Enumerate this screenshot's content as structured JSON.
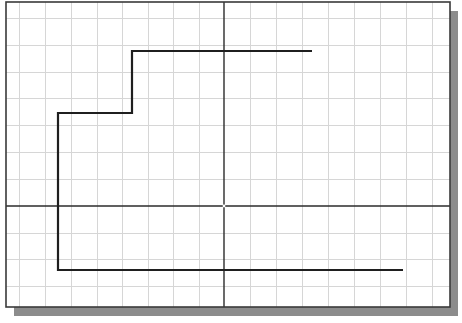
{
  "canvas": {
    "width": 462,
    "height": 323,
    "background": "#ffffff"
  },
  "frame": {
    "x": 6,
    "y": 2,
    "width": 444,
    "height": 305,
    "border_color": "#3a3a3a",
    "border_width": 1.6,
    "fill": "#ffffff"
  },
  "shadow": {
    "offset_x": 8,
    "offset_y": 9,
    "color": "#8c8c8c"
  },
  "grid": {
    "color": "#d6d6d6",
    "line_width": 1,
    "vertical_x": [
      19,
      45,
      71,
      97,
      122,
      148,
      173,
      199,
      250,
      276,
      302,
      328,
      354,
      380,
      406,
      432
    ],
    "horizontal_y": [
      18,
      45,
      72,
      98,
      125,
      152,
      179,
      233,
      259,
      286
    ]
  },
  "axes": {
    "color": "#2b2b2b",
    "line_width": 1.4,
    "origin": {
      "x": 224,
      "y": 206
    },
    "origin_marker_color": "#ffffff"
  },
  "polyline": {
    "color": "#1f1f1f",
    "line_width": 2.2,
    "points": [
      {
        "x": 312,
        "y": 51
      },
      {
        "x": 132,
        "y": 51
      },
      {
        "x": 132,
        "y": 113
      },
      {
        "x": 58,
        "y": 113
      },
      {
        "x": 58,
        "y": 270
      },
      {
        "x": 403,
        "y": 270
      }
    ]
  }
}
